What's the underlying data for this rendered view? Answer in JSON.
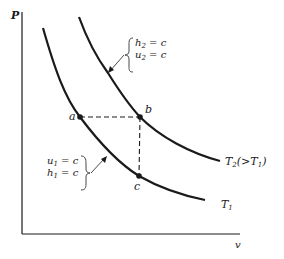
{
  "diagram": {
    "type": "P-v diagram with isotherms",
    "axes": {
      "y_label": "P",
      "x_label": "v"
    },
    "curves": [
      {
        "id": "T1",
        "label": "T",
        "label_sub": "1",
        "label_suffix": ""
      },
      {
        "id": "T2",
        "label": "T",
        "label_sub": "2",
        "label_suffix": "(>T",
        "label_suffix_sub": "1",
        "label_suffix_end": ")"
      }
    ],
    "points": {
      "a": "a",
      "b": "b",
      "c": "c"
    },
    "annotations": {
      "upper": {
        "line1_var": "h",
        "line1_sub": "2",
        "line1_rhs": " = c",
        "line2_var": "u",
        "line2_sub": "2",
        "line2_rhs": " = c"
      },
      "lower": {
        "line1_var": "u",
        "line1_sub": "1",
        "line1_rhs": " = c",
        "line2_var": "h",
        "line2_sub": "1",
        "line2_rhs": " = c"
      }
    },
    "colors": {
      "ink": "#1a1a1a",
      "background": "#ffffff"
    }
  }
}
